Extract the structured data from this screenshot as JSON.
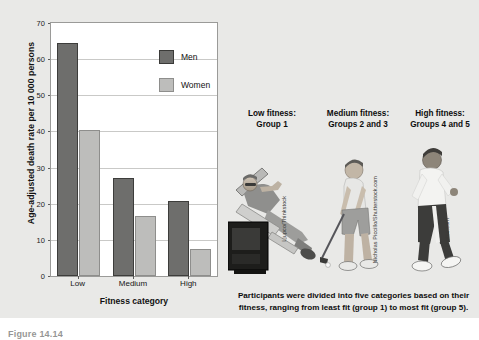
{
  "figure": {
    "number_label": "Figure 14.14",
    "background_color": "#e9e9e7"
  },
  "chart_data": {
    "type": "bar",
    "title": "",
    "xlabel": "Fitness category",
    "ylabel": "Age-adjusted death rate per 10 000 persons",
    "categories": [
      "Low",
      "Medium",
      "High"
    ],
    "series": [
      {
        "name": "Men",
        "color": "#6e6e6c",
        "values": [
          64.5,
          27.0,
          20.7
        ]
      },
      {
        "name": "Women",
        "color": "#bdbdbb",
        "values": [
          40.5,
          16.5,
          7.5
        ]
      }
    ],
    "ylim": [
      0,
      70
    ],
    "yticks": [
      0,
      10,
      20,
      30,
      40,
      50,
      60,
      70
    ],
    "grid": true,
    "legend_position": "top-center"
  },
  "legend": {
    "entries": [
      {
        "label": "Men",
        "color": "#6e6e6c"
      },
      {
        "label": "Women",
        "color": "#bdbdbb"
      }
    ]
  },
  "groups": [
    {
      "title": "Low fitness:",
      "subtitle": "Group 1",
      "credit": "Ljupco/Thinkstock",
      "photo": "man-reclining-in-lounge-chair-watching-tv"
    },
    {
      "title": "Medium fitness:",
      "subtitle": "Groups 2 and 3",
      "credit": "Nicholas Piccillo/Shutterstock.com",
      "photo": "man-playing-golf-putting"
    },
    {
      "title": "High fitness:",
      "subtitle": "Groups 4 and 5",
      "credit": "© photos.com",
      "photo": "man-jogging-running"
    }
  ],
  "caption": {
    "line1": "Participants were divided into five categories based on their",
    "line2": "fitness, ranging from least fit (group 1) to most fit (group 5)."
  }
}
